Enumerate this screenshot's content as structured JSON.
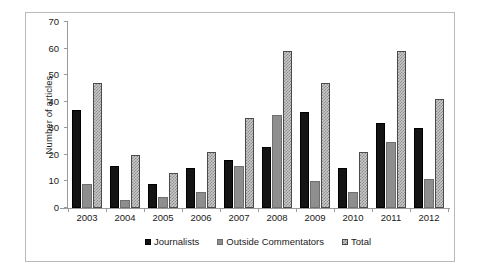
{
  "chart_data": {
    "type": "bar",
    "title": "",
    "subtitle": "",
    "xlabel": "",
    "ylabel": "Number of articles",
    "categories": [
      "2003",
      "2004",
      "2005",
      "2006",
      "2007",
      "2008",
      "2009",
      "2010",
      "2011",
      "2012"
    ],
    "series": [
      {
        "name": "Journalists",
        "color": "#141414",
        "pattern": "solid-black",
        "values": [
          37,
          16,
          9,
          15,
          18,
          23,
          36,
          15,
          32,
          30
        ]
      },
      {
        "name": "Outside Commentators",
        "color": "#8e8e8e",
        "pattern": "solid-gray",
        "values": [
          9,
          3,
          4,
          6,
          16,
          35,
          10,
          6,
          25,
          11
        ]
      },
      {
        "name": "Total",
        "color": "#c9c9c9",
        "pattern": "checkered",
        "values": [
          47,
          20,
          13,
          21,
          34,
          59,
          47,
          21,
          59,
          41
        ]
      }
    ],
    "ylim": [
      0,
      70
    ],
    "ytick_step": 10,
    "yticks": [
      "70",
      "60",
      "50",
      "40",
      "30",
      "20",
      "10",
      "0"
    ],
    "grid": false,
    "legend_position": "bottom"
  },
  "legend": {
    "items": [
      {
        "label": "Journalists",
        "swatch": "swatch-journalists-icon"
      },
      {
        "label": "Outside Commentators",
        "swatch": "swatch-outside-commentators-icon"
      },
      {
        "label": "Total",
        "swatch": "swatch-total-icon"
      }
    ]
  },
  "axes": {
    "y_title": "Number of articles"
  }
}
